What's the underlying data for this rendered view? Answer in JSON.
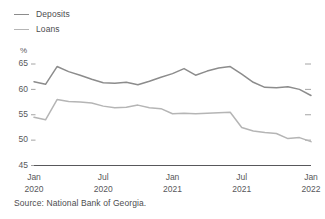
{
  "legend": {
    "position": "top-left",
    "items": [
      {
        "label": "Deposits",
        "color": "#8c8c8c",
        "icon": "line-swatch-icon"
      },
      {
        "label": "Loans",
        "color": "#b5b5b5",
        "icon": "line-swatch-icon"
      }
    ]
  },
  "axis": {
    "unit": "%",
    "y_ticks": [
      "65",
      "60",
      "55",
      "50",
      "45"
    ],
    "x_ticks": [
      {
        "month": "Jan",
        "year": "2020"
      },
      {
        "month": "Jul",
        "year": "2020"
      },
      {
        "month": "Jan",
        "year": "2021"
      },
      {
        "month": "Jul",
        "year": "2021"
      },
      {
        "month": "Jan",
        "year": "2022"
      }
    ]
  },
  "source": "Source: National Bank of Georgia.",
  "chart_data": {
    "type": "line",
    "title": "",
    "subtitle": "",
    "xlabel": "",
    "ylabel": "%",
    "ylim": [
      45,
      65
    ],
    "yticks": [
      45,
      50,
      55,
      60,
      65
    ],
    "grid": false,
    "legend_position": "top-left",
    "x": [
      "Jan 2020",
      "Feb 2020",
      "Mar 2020",
      "Apr 2020",
      "May 2020",
      "Jun 2020",
      "Jul 2020",
      "Aug 2020",
      "Sep 2020",
      "Oct 2020",
      "Nov 2020",
      "Dec 2020",
      "Jan 2021",
      "Feb 2021",
      "Mar 2021",
      "Apr 2021",
      "May 2021",
      "Jun 2021",
      "Jul 2021",
      "Aug 2021",
      "Sep 2021",
      "Oct 2021",
      "Nov 2021",
      "Dec 2021",
      "Jan 2022"
    ],
    "series": [
      {
        "name": "Deposits",
        "color": "#8c8c8c",
        "values": [
          61.5,
          61.0,
          64.5,
          63.5,
          62.8,
          62.0,
          61.3,
          61.2,
          61.4,
          60.9,
          61.6,
          62.4,
          63.1,
          64.1,
          62.8,
          63.6,
          64.2,
          64.5,
          63.0,
          61.4,
          60.4,
          60.3,
          60.5,
          60.0,
          58.8
        ]
      },
      {
        "name": "Loans",
        "color": "#b5b5b5",
        "values": [
          54.5,
          54.0,
          58.0,
          57.6,
          57.5,
          57.3,
          56.7,
          56.4,
          56.5,
          56.9,
          56.4,
          56.2,
          55.2,
          55.3,
          55.2,
          55.3,
          55.4,
          55.5,
          52.5,
          51.8,
          51.5,
          51.3,
          50.3,
          50.5,
          49.7
        ]
      }
    ]
  }
}
